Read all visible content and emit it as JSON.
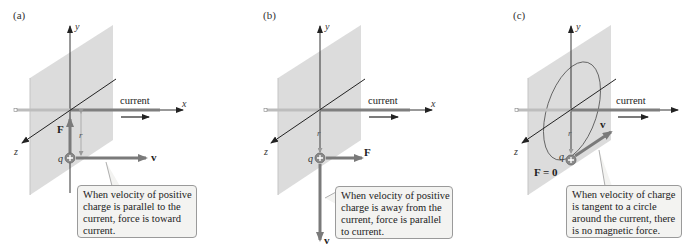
{
  "figure": {
    "colors": {
      "plane": "#dcdcdc",
      "wire_light": "#bdbdbd",
      "wire_dark": "#7f7f7f",
      "vector": "#7a7a7a",
      "axis": "#222222",
      "callout_bg": "#f3f3f1",
      "callout_border": "#9a9a9a"
    },
    "panels": [
      {
        "id": "a",
        "label": "(a)",
        "axis_labels": {
          "x": "x",
          "y": "y",
          "z": "z"
        },
        "current_label": "current",
        "charge_label": "q",
        "distance_label": "r",
        "velocity_label": "v",
        "force_label": "F",
        "velocity_direction": "parallel to current (+x)",
        "force_direction": "toward current (+y)",
        "callout": [
          "When velocity of positive",
          "charge is parallel to the",
          "current, force is toward",
          "current."
        ]
      },
      {
        "id": "b",
        "label": "(b)",
        "axis_labels": {
          "x": "x",
          "y": "y",
          "z": "z"
        },
        "current_label": "current",
        "charge_label": "q",
        "distance_label": "r",
        "velocity_label": "v",
        "force_label": "F",
        "velocity_direction": "away from current (−y)",
        "force_direction": "parallel to current (+x)",
        "callout": [
          "When velocity of positive",
          "charge is away from the",
          "current, force is parallel",
          "to current."
        ]
      },
      {
        "id": "c",
        "label": "(c)",
        "axis_labels": {
          "x": "x",
          "y": "y",
          "z": "z"
        },
        "current_label": "current",
        "charge_label": "q",
        "distance_label": "r",
        "velocity_label": "v",
        "force_label": "F = 0",
        "velocity_direction": "tangent to circle around current",
        "force_direction": "none",
        "callout": [
          "When velocity of charge",
          "is tangent to a circle",
          "around the current, there",
          "is no magnetic force."
        ]
      }
    ]
  }
}
